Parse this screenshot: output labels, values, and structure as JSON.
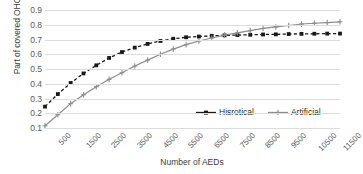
{
  "chart_data": {
    "type": "line",
    "title": "",
    "xlabel": "Number of AEDs",
    "ylabel": "Part of covered OHCAs",
    "x": [
      500,
      1000,
      1500,
      2000,
      2500,
      3000,
      3500,
      4000,
      4500,
      5000,
      5500,
      6000,
      6500,
      7000,
      7500,
      8000,
      8500,
      9000,
      9500,
      10000,
      10500,
      11000,
      11500,
      12000
    ],
    "xticks": [
      "500",
      "1500",
      "2500",
      "3500",
      "4500",
      "5500",
      "6500",
      "7500",
      "8500",
      "9500",
      "10500",
      "11500"
    ],
    "yticks": [
      "0.1",
      "0.2",
      "0.3",
      "0.4",
      "0.5",
      "0.6",
      "0.7",
      "0.8",
      "0.9"
    ],
    "xlim": [
      500,
      12000
    ],
    "ylim": [
      0.1,
      0.9
    ],
    "grid": true,
    "legend_position": "inside-bottom-right",
    "series": [
      {
        "name": "Hisrotical",
        "color": "#1a1a1a",
        "marker": "square",
        "dash": "dashed",
        "values": [
          0.245,
          0.33,
          0.405,
          0.47,
          0.525,
          0.575,
          0.615,
          0.645,
          0.67,
          0.69,
          0.705,
          0.715,
          0.72,
          0.725,
          0.728,
          0.73,
          0.732,
          0.734,
          0.735,
          0.737,
          0.738,
          0.739,
          0.74,
          0.74
        ]
      },
      {
        "name": "Artificial",
        "color": "#8c8c8c",
        "marker": "plus",
        "dash": "solid",
        "values": [
          0.115,
          0.19,
          0.265,
          0.325,
          0.38,
          0.43,
          0.475,
          0.52,
          0.56,
          0.6,
          0.635,
          0.665,
          0.69,
          0.71,
          0.73,
          0.745,
          0.76,
          0.775,
          0.785,
          0.795,
          0.805,
          0.81,
          0.815,
          0.82
        ]
      }
    ]
  },
  "legend": {
    "items": [
      {
        "label": "Hisrotical"
      },
      {
        "label": "Artificial"
      }
    ]
  }
}
